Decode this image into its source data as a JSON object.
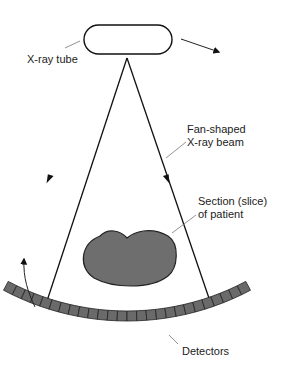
{
  "diagram": {
    "labels": {
      "xray_tube": "X-ray tube",
      "beam_line1": "Fan-shaped",
      "beam_line2": "X-ray beam",
      "section_line1": "Section (slice)",
      "section_line2": "of patient",
      "detectors": "Detectors"
    },
    "components": [
      {
        "id": "xray-tube",
        "shape": "rounded-capsule",
        "fill": "#ffffff"
      },
      {
        "id": "fan-beam",
        "shape": "fan",
        "arrows_per_edge": 2
      },
      {
        "id": "patient-section",
        "shape": "kidney",
        "fill": "#6e6e6e"
      },
      {
        "id": "detector-array",
        "shape": "arc",
        "cell_count": 26,
        "fill": "#6a6a6a"
      }
    ],
    "motion_arrows": [
      {
        "id": "tube-rotation-arrow",
        "direction": "clockwise"
      },
      {
        "id": "detector-rotation-arrow",
        "direction": "clockwise"
      }
    ]
  }
}
